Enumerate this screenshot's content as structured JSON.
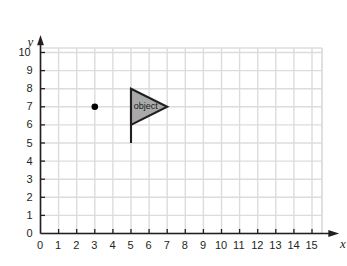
{
  "chart_data": {
    "type": "scatter",
    "title": "",
    "xlabel": "x",
    "ylabel": "y",
    "xlim": [
      0,
      15
    ],
    "ylim": [
      0,
      10
    ],
    "grid": true,
    "legend": null,
    "x_ticks": [
      "0",
      "1",
      "2",
      "3",
      "4",
      "5",
      "6",
      "7",
      "8",
      "9",
      "10",
      "11",
      "12",
      "13",
      "14",
      "15"
    ],
    "y_ticks": [
      "0",
      "1",
      "2",
      "3",
      "4",
      "5",
      "6",
      "7",
      "8",
      "9",
      "10"
    ],
    "points": [
      {
        "name": "center-of-rotation-point",
        "x": 3,
        "y": 7,
        "label": ""
      }
    ],
    "shapes": [
      {
        "name": "object-flag",
        "label": "object",
        "label_x": 5.15,
        "label_y": 7.0,
        "fill": "#a9a9a9",
        "stroke": "#231f20",
        "triangle": [
          [
            5,
            8
          ],
          [
            5,
            6
          ],
          [
            7,
            7
          ]
        ],
        "pole": {
          "x": 5,
          "y_top": 8,
          "y_bottom": 5
        }
      }
    ],
    "colors": {
      "grid": "#dcdcdc",
      "axis": "#231f20",
      "text": "#231f20",
      "shape_fill": "#a9a9a9",
      "shape_stroke": "#231f20",
      "point": "#000000",
      "background": "#ffffff"
    }
  }
}
